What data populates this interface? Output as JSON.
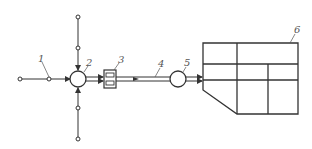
{
  "diagram": {
    "type": "flow-schematic",
    "line_color": "#333333",
    "label_color": "#555555",
    "labels": {
      "l1": "1",
      "l2": "2",
      "l3": "3",
      "l4": "4",
      "l5": "5",
      "l6": "6"
    },
    "components": [
      {
        "id": "1",
        "kind": "inlet-node"
      },
      {
        "id": "2",
        "kind": "junction-circle"
      },
      {
        "id": "3",
        "kind": "dual-channel-box"
      },
      {
        "id": "4",
        "kind": "double-line-conduit"
      },
      {
        "id": "5",
        "kind": "circle-unit"
      },
      {
        "id": "6",
        "kind": "grid-block"
      }
    ]
  }
}
